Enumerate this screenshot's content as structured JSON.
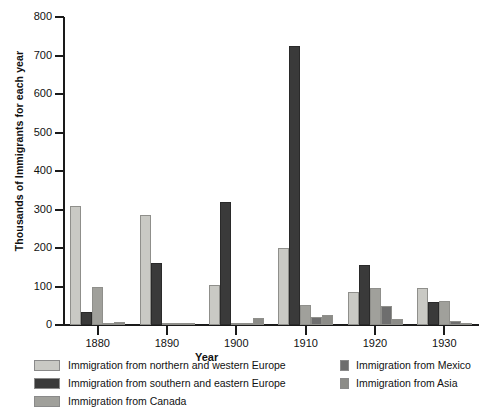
{
  "chart_data": {
    "type": "bar",
    "title": "",
    "xlabel": "Year",
    "ylabel": "Thousands of Immigrants for each year",
    "categories": [
      "1880",
      "1890",
      "1900",
      "1910",
      "1920",
      "1930"
    ],
    "ylim": [
      0,
      800
    ],
    "yticks": [
      0,
      100,
      200,
      300,
      400,
      500,
      600,
      700,
      800
    ],
    "grid": false,
    "legend_position": "below-plot-two-columns",
    "series": [
      {
        "name": "Immigration from northern and western Europe",
        "color": "#c9c9c4",
        "values": [
          310,
          285,
          105,
          200,
          85,
          95
        ]
      },
      {
        "name": "Immigration from southern and eastern Europe",
        "color": "#3a3a3a",
        "values": [
          35,
          160,
          320,
          725,
          155,
          60
        ]
      },
      {
        "name": "Immigration from Canada",
        "color": "#a0a09b",
        "values": [
          100,
          2,
          1,
          53,
          95,
          62
        ]
      },
      {
        "name": "Immigration from Mexico",
        "color": "#6e6e6e",
        "values": [
          0,
          0,
          0,
          22,
          50,
          10
        ]
      },
      {
        "name": "Immigration from Asia",
        "color": "#8c8c88",
        "values": [
          8,
          2,
          17,
          25,
          15,
          3
        ]
      }
    ]
  },
  "legend": {
    "left_items": [
      "Immigration from northern and western Europe",
      "Immigration from southern and eastern Europe",
      "Immigration from Canada"
    ],
    "right_items": [
      "Immigration from Mexico",
      "Immigration from Asia"
    ]
  }
}
